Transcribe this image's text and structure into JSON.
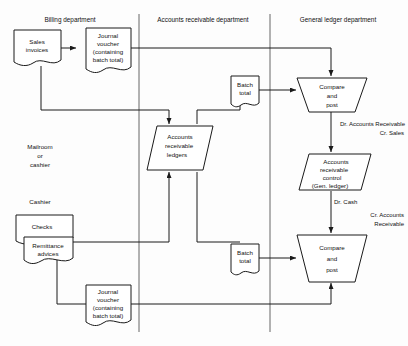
{
  "diagram": {
    "line_color": "#1a1a1a",
    "fill_color": "#ffffff",
    "columns": [
      {
        "id": "billing",
        "label": "Billing department"
      },
      {
        "id": "ar",
        "label": "Accounts receivable department"
      },
      {
        "id": "gl",
        "label": "General ledger department"
      }
    ],
    "swimlane_notes": [
      {
        "id": "mailroom",
        "lines": [
          "Mailroom",
          "or",
          "cashier"
        ]
      },
      {
        "id": "cashier",
        "lines": [
          "Cashier"
        ]
      }
    ],
    "nodes": [
      {
        "id": "sales-invoices",
        "shape": "document",
        "lines": [
          "Sales",
          "invoices"
        ]
      },
      {
        "id": "journal-voucher-top",
        "shape": "document",
        "lines": [
          "Journal",
          "voucher",
          "(containing",
          "batch total)"
        ]
      },
      {
        "id": "ar-ledgers",
        "shape": "parallelogram",
        "lines": [
          "Accounts",
          "receivable",
          "ledgers"
        ]
      },
      {
        "id": "batch-total-top",
        "shape": "document",
        "lines": [
          "Batch",
          "total"
        ]
      },
      {
        "id": "compare-post-top",
        "shape": "trapezoid",
        "lines": [
          "Compare",
          "and",
          "post"
        ]
      },
      {
        "id": "ar-control",
        "shape": "parallelogram",
        "lines": [
          "Accounts",
          "receivable",
          "control",
          "(Gen. ledger)"
        ]
      },
      {
        "id": "checks",
        "shape": "document",
        "lines": [
          "Checks"
        ]
      },
      {
        "id": "remittance-advices",
        "shape": "document",
        "lines": [
          "Remittance",
          "advices"
        ]
      },
      {
        "id": "batch-total-bottom",
        "shape": "document",
        "lines": [
          "Batch",
          "total"
        ]
      },
      {
        "id": "compare-post-bottom",
        "shape": "trapezoid",
        "lines": [
          "Compare",
          "and",
          "post"
        ]
      },
      {
        "id": "journal-voucher-bottom",
        "shape": "document",
        "lines": [
          "Journal",
          "voucher",
          "(containing",
          "batch total)"
        ]
      }
    ],
    "annotations": [
      {
        "id": "entry-sales",
        "lines": [
          "Dr. Accounts Receivable",
          "Cr. Sales"
        ]
      },
      {
        "id": "entry-cash",
        "lines": [
          "Dr. Cash",
          "Cr. Accounts",
          "Receivable"
        ]
      }
    ]
  }
}
